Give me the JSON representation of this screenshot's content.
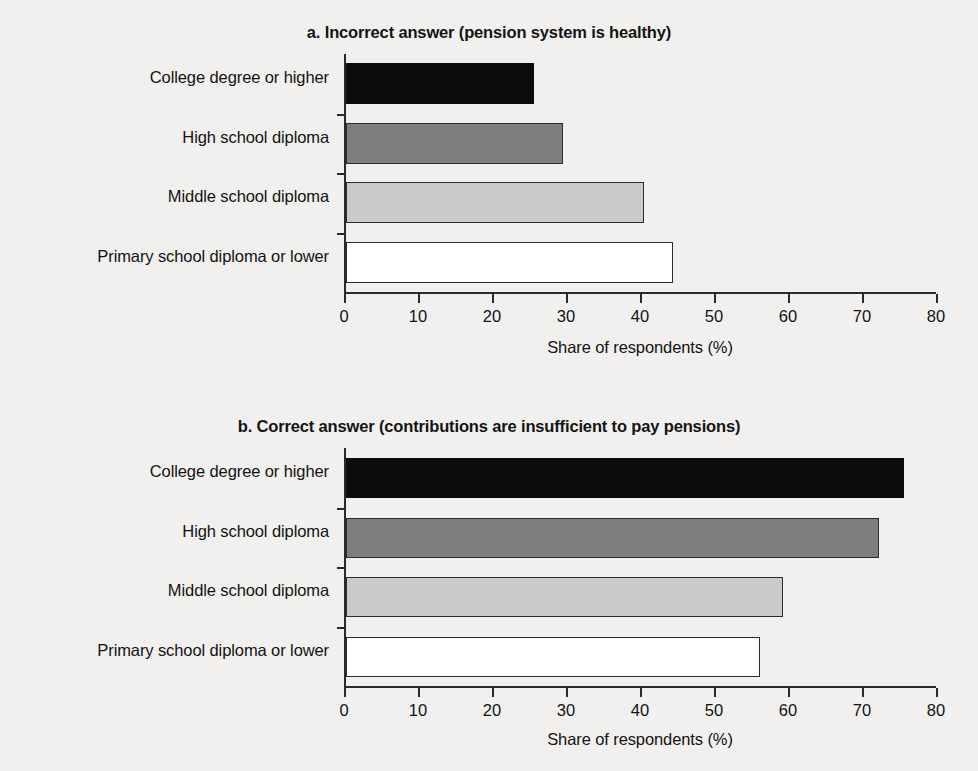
{
  "figure": {
    "background_color": "#f1f0ee",
    "axis_color": "#2a2a2a"
  },
  "panels": [
    {
      "id": "a",
      "title": "a. Incorrect answer (pension system is healthy)",
      "xlabel": "Share of respondents (%)"
    },
    {
      "id": "b",
      "title": "b. Correct answer (contributions are insufficient to pay pensions)",
      "xlabel": "Share of respondents (%)"
    }
  ],
  "axis": {
    "ticks": [
      "0",
      "10",
      "20",
      "30",
      "40",
      "50",
      "60",
      "70",
      "80"
    ]
  },
  "categories": [
    "College degree or higher",
    "High school diploma",
    "Middle school diploma",
    "Primary school diploma or lower"
  ],
  "bar_colors": [
    "#0d0d0d",
    "#7d7d7d",
    "#c9c9c9",
    "#ffffff"
  ],
  "chart_data": [
    {
      "type": "bar",
      "orientation": "horizontal",
      "title": "a. Incorrect answer (pension system is healthy)",
      "xlabel": "Share of respondents (%)",
      "ylabel": "",
      "categories": [
        "College degree or higher",
        "High school diploma",
        "Middle school diploma",
        "Primary school diploma or lower"
      ],
      "values": [
        25.4,
        29.3,
        40.3,
        44.2
      ],
      "xlim": [
        0,
        80
      ],
      "xticks": [
        0,
        10,
        20,
        30,
        40,
        50,
        60,
        70,
        80
      ],
      "grid": false,
      "legend": "none",
      "bar_colors": [
        "#0d0d0d",
        "#7d7d7d",
        "#c9c9c9",
        "#ffffff"
      ]
    },
    {
      "type": "bar",
      "orientation": "horizontal",
      "title": "b. Correct answer (contributions are insufficient to pay pensions)",
      "xlabel": "Share of respondents (%)",
      "ylabel": "",
      "categories": [
        "College degree or higher",
        "High school diploma",
        "Middle school diploma",
        "Primary school diploma or lower"
      ],
      "values": [
        75.4,
        72.0,
        59.0,
        56.0
      ],
      "xlim": [
        0,
        80
      ],
      "xticks": [
        0,
        10,
        20,
        30,
        40,
        50,
        60,
        70,
        80
      ],
      "grid": false,
      "legend": "none",
      "bar_colors": [
        "#0d0d0d",
        "#7d7d7d",
        "#c9c9c9",
        "#ffffff"
      ]
    }
  ]
}
